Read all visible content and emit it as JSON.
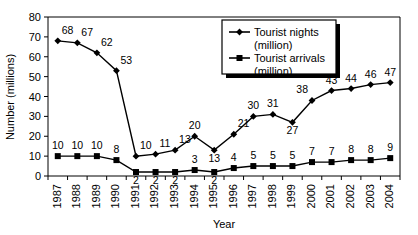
{
  "chart_data": {
    "type": "line",
    "title": "",
    "xlabel": "Year",
    "ylabel": "Number (millions)",
    "categories": [
      "1987",
      "1988",
      "1989",
      "1990",
      "1991",
      "1992",
      "1993",
      "1994",
      "1995",
      "1996",
      "1997",
      "1998",
      "1999",
      "2000",
      "2001",
      "2002",
      "2003",
      "2004"
    ],
    "x": [
      1987,
      1988,
      1989,
      1990,
      1991,
      1992,
      1993,
      1994,
      1995,
      1996,
      1997,
      1998,
      1999,
      2000,
      2001,
      2002,
      2003,
      2004
    ],
    "ylim": [
      0,
      80
    ],
    "yticks": [
      0,
      10,
      20,
      30,
      40,
      50,
      60,
      70,
      80
    ],
    "ytick_labels": [
      "0",
      "10",
      "20",
      "30",
      "40",
      "50",
      "60",
      "70",
      "80"
    ],
    "grid": false,
    "legend_position": "top-right",
    "series": [
      {
        "name": "Tourist nights (million)",
        "legend_line1": "Tourist nights",
        "legend_line2": "(million)",
        "marker": "diamond",
        "values": [
          68,
          67,
          62,
          53,
          10,
          11,
          13,
          20,
          13,
          21,
          30,
          31,
          27,
          38,
          43,
          44,
          46,
          47
        ],
        "labels": [
          "68",
          "67",
          "62",
          "53",
          "10",
          "11",
          "13",
          "20",
          "13",
          "21",
          "30",
          "31",
          "27",
          "38",
          "43",
          "44",
          "46",
          "47"
        ]
      },
      {
        "name": "Tourist arrivals (million)",
        "legend_line1": "Tourist arrivals",
        "legend_line2": "(million)",
        "marker": "square",
        "values": [
          10,
          10,
          10,
          8,
          2,
          2,
          2,
          3,
          2,
          4,
          5,
          5,
          5,
          7,
          7,
          8,
          8,
          9
        ],
        "labels": [
          "10",
          "10",
          "10",
          "8",
          "2",
          "2",
          "2",
          "3",
          "2",
          "4",
          "5",
          "5",
          "5",
          "7",
          "7",
          "8",
          "8",
          "9"
        ]
      }
    ],
    "colors": {
      "line": "#000000",
      "background": "#ffffff",
      "axis": "#000000"
    }
  }
}
